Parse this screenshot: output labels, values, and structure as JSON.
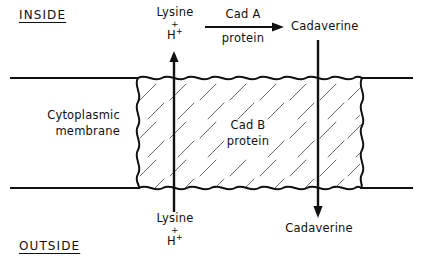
{
  "figure": {
    "colors": {
      "ink": "#111111",
      "hatch": "#555555",
      "background": "#ffffff"
    }
  },
  "compartments": {
    "inside_label": "INSIDE",
    "outside_label": "OUTSIDE"
  },
  "membrane": {
    "label_line1": "Cytoplasmic",
    "label_line2": "membrane"
  },
  "transporter": {
    "label_line1": "Cad B",
    "label_line2": "protein"
  },
  "enzyme": {
    "label_line1": "Cad A",
    "label_line2": "protein"
  },
  "substrates": {
    "lysine_top": "Lysine",
    "lysine_top_plus": "+",
    "lysine_top_proton": "H",
    "lysine_top_proton_charge": "+",
    "lysine_bottom": "Lysine",
    "lysine_bottom_plus": "+",
    "lysine_bottom_proton": "H",
    "lysine_bottom_proton_charge": "+",
    "cadaverine_top": "Cadaverine",
    "cadaverine_bottom": "Cadaverine"
  },
  "arrows": {
    "lysine_influx": "arrow-up",
    "cadaverine_efflux": "arrow-down",
    "enzyme_reaction": "arrow-right"
  }
}
